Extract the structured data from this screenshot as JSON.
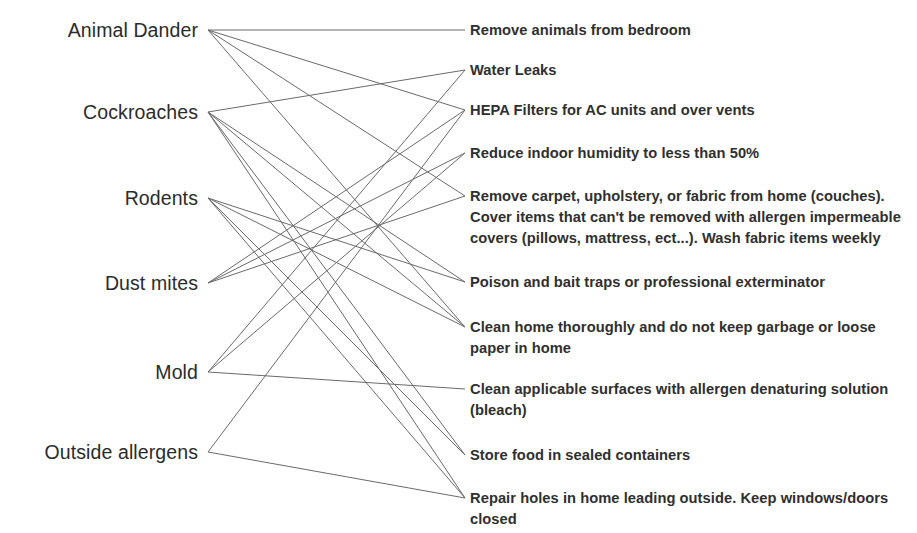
{
  "diagram": {
    "type": "bipartite-mapping",
    "title": "",
    "left_column_header": "",
    "right_column_header": "",
    "line_color": "#6a6a6a",
    "text_color": "#2b2b2b",
    "background": "#ffffff",
    "allergens": [
      {
        "id": "animal-dander",
        "label": "Animal Dander",
        "x": 208,
        "y": 30,
        "label_right": 198
      },
      {
        "id": "cockroaches",
        "label": "Cockroaches",
        "x": 208,
        "y": 112,
        "label_right": 198
      },
      {
        "id": "rodents",
        "label": "Rodents",
        "x": 208,
        "y": 198,
        "label_right": 198
      },
      {
        "id": "dust-mites",
        "label": "Dust mites",
        "x": 208,
        "y": 283,
        "label_right": 198
      },
      {
        "id": "mold",
        "label": "Mold",
        "x": 208,
        "y": 372,
        "label_right": 198
      },
      {
        "id": "outside-allergens",
        "label": "Outside allergens",
        "x": 208,
        "y": 452,
        "label_right": 198
      }
    ],
    "actions": [
      {
        "id": "remove-animals",
        "text": "Remove animals from bedroom",
        "x": 465,
        "y": 30,
        "lines": 1
      },
      {
        "id": "water-leaks",
        "text": "Water Leaks",
        "x": 465,
        "y": 70,
        "lines": 1
      },
      {
        "id": "hepa-filters",
        "text": "HEPA Filters for AC units and over vents",
        "x": 465,
        "y": 110,
        "lines": 1
      },
      {
        "id": "reduce-humidity",
        "text": "Reduce indoor humidity to less than 50%",
        "x": 465,
        "y": 153,
        "lines": 1
      },
      {
        "id": "remove-carpet",
        "text": "Remove carpet, upholstery, or fabric from home (couches). Cover items that can't be removed with allergen impermeable covers (pillows, mattress, ect...). Wash fabric items weekly",
        "x": 465,
        "y": 196,
        "lines": 3
      },
      {
        "id": "poison-bait-traps",
        "text": "Poison and bait traps or professional exterminator",
        "x": 465,
        "y": 282,
        "lines": 1
      },
      {
        "id": "clean-home",
        "text": "Clean home thoroughly and do not keep garbage or loose paper in home",
        "x": 465,
        "y": 327,
        "lines": 2
      },
      {
        "id": "clean-surfaces",
        "text": "Clean applicable surfaces with allergen denaturing solution (bleach)",
        "x": 465,
        "y": 389,
        "lines": 2
      },
      {
        "id": "store-food",
        "text": "Store food in sealed containers",
        "x": 465,
        "y": 455,
        "lines": 1
      },
      {
        "id": "repair-holes",
        "text": "Repair holes in home leading outside. Keep windows/doors closed",
        "x": 465,
        "y": 498,
        "lines": 2
      }
    ],
    "edges": [
      {
        "from": "animal-dander",
        "to": "remove-animals"
      },
      {
        "from": "animal-dander",
        "to": "hepa-filters"
      },
      {
        "from": "animal-dander",
        "to": "remove-carpet"
      },
      {
        "from": "animal-dander",
        "to": "clean-home"
      },
      {
        "from": "cockroaches",
        "to": "water-leaks"
      },
      {
        "from": "cockroaches",
        "to": "poison-bait-traps"
      },
      {
        "from": "cockroaches",
        "to": "clean-home"
      },
      {
        "from": "cockroaches",
        "to": "store-food"
      },
      {
        "from": "cockroaches",
        "to": "repair-holes"
      },
      {
        "from": "rodents",
        "to": "poison-bait-traps"
      },
      {
        "from": "rodents",
        "to": "clean-home"
      },
      {
        "from": "rodents",
        "to": "store-food"
      },
      {
        "from": "rodents",
        "to": "repair-holes"
      },
      {
        "from": "dust-mites",
        "to": "reduce-humidity"
      },
      {
        "from": "dust-mites",
        "to": "remove-carpet"
      },
      {
        "from": "dust-mites",
        "to": "hepa-filters"
      },
      {
        "from": "mold",
        "to": "water-leaks"
      },
      {
        "from": "mold",
        "to": "reduce-humidity"
      },
      {
        "from": "mold",
        "to": "clean-surfaces"
      },
      {
        "from": "outside-allergens",
        "to": "hepa-filters"
      },
      {
        "from": "outside-allergens",
        "to": "repair-holes"
      }
    ]
  }
}
